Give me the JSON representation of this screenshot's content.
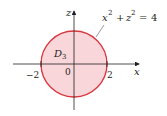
{
  "figure": {
    "type": "region-diagram",
    "region_label": "D",
    "region_subscript": "3",
    "equation": {
      "x_var": "x",
      "z_var": "z",
      "exponent": "2",
      "plus": "+",
      "equals": "=",
      "rhs": "4"
    },
    "axes": {
      "horizontal_label": "x",
      "vertical_label": "z"
    },
    "ticks": {
      "left": "−2",
      "origin": "0",
      "right": "2"
    },
    "colors": {
      "fill": "#f8d6da",
      "stroke": "#d9363e",
      "axis": "#231f20"
    }
  }
}
